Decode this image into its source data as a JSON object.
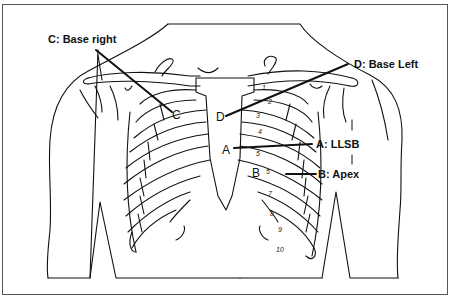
{
  "diagram": {
    "labels": [
      {
        "id": "C",
        "text": "C: Base right",
        "marker": "C"
      },
      {
        "id": "D",
        "text": "D: Base Left",
        "marker": "D"
      },
      {
        "id": "A",
        "text": "A: LLSB",
        "marker": "A"
      },
      {
        "id": "B",
        "text": "B: Apex",
        "marker": "B"
      }
    ],
    "rib_numbers": [
      "1",
      "2",
      "3",
      "4",
      "5",
      "5",
      "7",
      "8",
      "9",
      "10"
    ],
    "colors": {
      "line": "#111111",
      "background": "#ffffff",
      "frame": "#555555"
    }
  }
}
